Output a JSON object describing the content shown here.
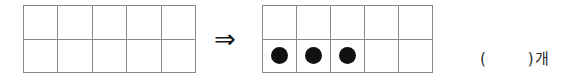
{
  "worksheet": {
    "type": "math-ten-frame-exercise",
    "arrow_symbol": "⇒",
    "left_frame": {
      "label": "empty-ten-frame",
      "columns": 5,
      "rows": 2,
      "filled_count": 0,
      "cells": [
        {
          "row": 1,
          "col": 1,
          "filled": false
        },
        {
          "row": 1,
          "col": 2,
          "filled": false
        },
        {
          "row": 1,
          "col": 3,
          "filled": false
        },
        {
          "row": 1,
          "col": 4,
          "filled": false
        },
        {
          "row": 1,
          "col": 5,
          "filled": false
        },
        {
          "row": 2,
          "col": 1,
          "filled": false
        },
        {
          "row": 2,
          "col": 2,
          "filled": false
        },
        {
          "row": 2,
          "col": 3,
          "filled": false
        },
        {
          "row": 2,
          "col": 4,
          "filled": false
        },
        {
          "row": 2,
          "col": 5,
          "filled": false
        }
      ]
    },
    "right_frame": {
      "label": "ten-frame-with-three-counters",
      "columns": 5,
      "rows": 2,
      "filled_count": 3,
      "cells": [
        {
          "row": 1,
          "col": 1,
          "filled": false
        },
        {
          "row": 1,
          "col": 2,
          "filled": false
        },
        {
          "row": 1,
          "col": 3,
          "filled": false
        },
        {
          "row": 1,
          "col": 4,
          "filled": false
        },
        {
          "row": 1,
          "col": 5,
          "filled": false
        },
        {
          "row": 2,
          "col": 1,
          "filled": true
        },
        {
          "row": 2,
          "col": 2,
          "filled": true
        },
        {
          "row": 2,
          "col": 3,
          "filled": true
        },
        {
          "row": 2,
          "col": 4,
          "filled": false
        },
        {
          "row": 2,
          "col": 5,
          "filled": false
        }
      ]
    },
    "answer": {
      "open_paren": "(",
      "value": "",
      "close_paren": ")",
      "unit": "개"
    },
    "colors": {
      "grid_line": "#8a8a8a",
      "counter_fill": "#111111",
      "text": "#2b2b2b",
      "background": "#ffffff"
    }
  }
}
